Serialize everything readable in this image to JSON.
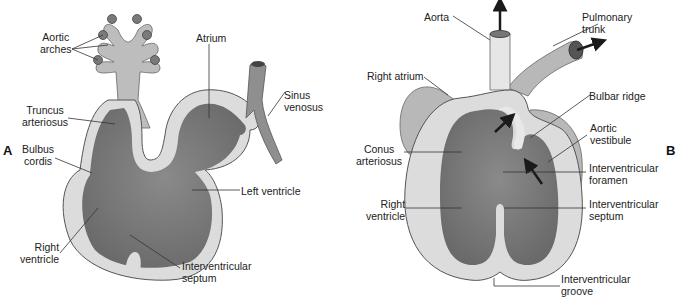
{
  "panels": {
    "a": {
      "letter": "A",
      "labels": {
        "aortic_arches_1": "Aortic",
        "aortic_arches_2": "arches",
        "atrium": "Atrium",
        "truncus_1": "Truncus",
        "truncus_2": "arteriosus",
        "sinus_1": "Sinus",
        "sinus_2": "venosus",
        "bulbus_1": "Bulbus",
        "bulbus_2": "cordis",
        "left_ventricle": "Left ventricle",
        "right_ventricle_1": "Right",
        "right_ventricle_2": "ventricle",
        "iv_septum_1": "Interventricular",
        "iv_septum_2": "septum"
      }
    },
    "b": {
      "letter": "B",
      "labels": {
        "aorta": "Aorta",
        "pulmonary_1": "Pulmonary",
        "pulmonary_2": "trunk",
        "right_atrium": "Right atrium",
        "bulbar_ridge": "Bulbar ridge",
        "aortic_vestibule_1": "Aortic",
        "aortic_vestibule_2": "vestibule",
        "conus_1": "Conus",
        "conus_2": "arteriosus",
        "iv_foramen_1": "Interventricular",
        "iv_foramen_2": "foramen",
        "right_ventricle_1": "Right",
        "right_ventricle_2": "ventricle",
        "iv_septum_1": "Interventricular",
        "iv_septum_2": "septum",
        "iv_groove_1": "Interventricular",
        "iv_groove_2": "groove"
      }
    }
  },
  "colors": {
    "wall": "#d9d9d9",
    "wall_outer": "#e8e8e8",
    "chamber": "#7f7f7f",
    "chamber_dark": "#5e5e5e",
    "vessel": "#b5b5b5",
    "outline": "#555555",
    "leader": "#333333",
    "arrow": "#1a1a1a"
  }
}
